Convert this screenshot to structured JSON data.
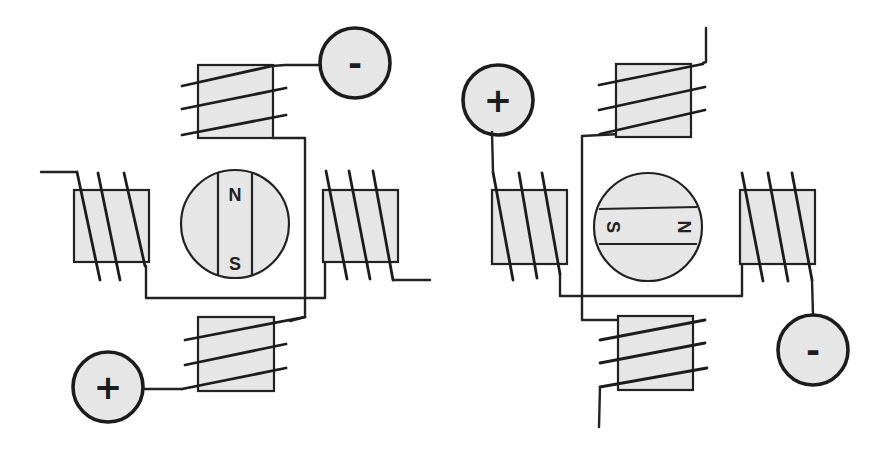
{
  "diagram": {
    "type": "stepper-motor-coil-schematic",
    "panels": [
      {
        "id": "left-motor",
        "rotor": {
          "orientation": "vertical",
          "north_label": "N",
          "south_label": "S"
        },
        "terminals": [
          {
            "polarity": "negative",
            "label": "-"
          },
          {
            "polarity": "positive",
            "label": "+"
          }
        ],
        "coils": [
          "top",
          "left",
          "right",
          "bottom"
        ]
      },
      {
        "id": "right-motor",
        "rotor": {
          "orientation": "horizontal",
          "north_label": "N",
          "south_label": "S"
        },
        "terminals": [
          {
            "polarity": "positive",
            "label": "+"
          },
          {
            "polarity": "negative",
            "label": "-"
          }
        ],
        "coils": [
          "top",
          "left",
          "right",
          "bottom"
        ]
      }
    ],
    "colors": {
      "fill": "#e6e6e6",
      "stroke": "#222222",
      "background": "#ffffff"
    }
  }
}
